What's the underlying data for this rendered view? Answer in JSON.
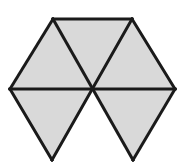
{
  "figure": {
    "shape_name": "regular-hexagon",
    "width": 191,
    "height": 163,
    "background_color": "#ffffff",
    "stroke_color": "#1a1a1a",
    "stroke_width": 3,
    "fill_shaded": "#d9d9d9",
    "fill_unshaded": "#ffffff",
    "shaded_count": "5",
    "unshaded_count": "1",
    "total_triangles": "6",
    "vertices": {
      "top_left": [
        53,
        19
      ],
      "top_right": [
        132,
        19
      ],
      "right": [
        175,
        89
      ],
      "bottom_right": [
        133,
        160
      ],
      "bottom_left": [
        52,
        160
      ],
      "left": [
        10,
        89
      ],
      "center": [
        93,
        89
      ]
    },
    "triangles": [
      {
        "name": "top-left-triangle",
        "position": "top-left",
        "points": "53,19 93,89 10,89",
        "fill": "#d9d9d9",
        "shaded": "shaded"
      },
      {
        "name": "top-center-triangle",
        "position": "top-center",
        "points": "53,19 132,19 93,89",
        "fill": "#d9d9d9",
        "shaded": "shaded"
      },
      {
        "name": "top-right-triangle",
        "position": "top-right",
        "points": "132,19 175,89 93,89",
        "fill": "#d9d9d9",
        "shaded": "shaded"
      },
      {
        "name": "bottom-right-triangle",
        "position": "bottom-right",
        "points": "93,89 175,89 133,160",
        "fill": "#d9d9d9",
        "shaded": "shaded"
      },
      {
        "name": "bottom-center-triangle",
        "position": "bottom-center",
        "points": "52,160 133,160 93,89",
        "fill": "#ffffff",
        "shaded": "unshaded"
      },
      {
        "name": "bottom-left-triangle",
        "position": "bottom-left",
        "points": "10,89 93,89 52,160",
        "fill": "#d9d9d9",
        "shaded": "shaded"
      }
    ],
    "edges": [
      {
        "name": "hexagon-edge-top",
        "d": "M 53,19 L 132,19"
      },
      {
        "name": "hexagon-edge-upper-right",
        "d": "M 132,19 L 175,89"
      },
      {
        "name": "hexagon-edge-lower-right",
        "d": "M 175,89 L 133,160"
      },
      {
        "name": "hexagon-edge-lower-left",
        "d": "M 52,160 L 10,89"
      },
      {
        "name": "hexagon-edge-upper-left",
        "d": "M 10,89 L 53,19"
      }
    ],
    "diagonals": [
      {
        "name": "diagonal-horizontal",
        "d": "M 10,89 L 175,89"
      },
      {
        "name": "diagonal-top-left-to-bottom-right",
        "d": "M 53,19 L 133,160"
      },
      {
        "name": "diagonal-top-right-to-bottom-left",
        "d": "M 132,19 L 52,160"
      }
    ]
  }
}
